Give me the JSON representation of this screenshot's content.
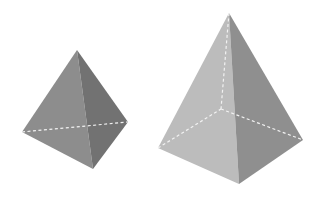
{
  "figure": {
    "background": "#ffffff",
    "shapes": [
      {
        "name": "triangular-pyramid",
        "vertices": {
          "apex": [
            77,
            50
          ],
          "base_left": [
            22,
            132
          ],
          "base_front": [
            93,
            169
          ],
          "base_right": [
            128,
            122
          ]
        },
        "faces": {
          "left_color": "#8d8d8d",
          "right_color": "#727272"
        },
        "hidden_edges": [
          [
            [
              22,
              132
            ],
            [
              128,
              122
            ]
          ]
        ]
      },
      {
        "name": "square-pyramid",
        "vertices": {
          "apex": [
            229,
            13
          ],
          "base_left": [
            158,
            148
          ],
          "base_front": [
            239,
            184
          ],
          "base_right": [
            303,
            140
          ],
          "base_back": [
            221,
            109
          ]
        },
        "faces": {
          "left_color": "#bcbcbc",
          "right_color": "#8f8f8f"
        },
        "hidden_edges": [
          [
            [
              229,
              13
            ],
            [
              221,
              109
            ]
          ],
          [
            [
              158,
              148
            ],
            [
              221,
              109
            ]
          ],
          [
            [
              221,
              109
            ],
            [
              303,
              140
            ]
          ]
        ]
      }
    ],
    "dash_color": "#f2f2f2"
  }
}
